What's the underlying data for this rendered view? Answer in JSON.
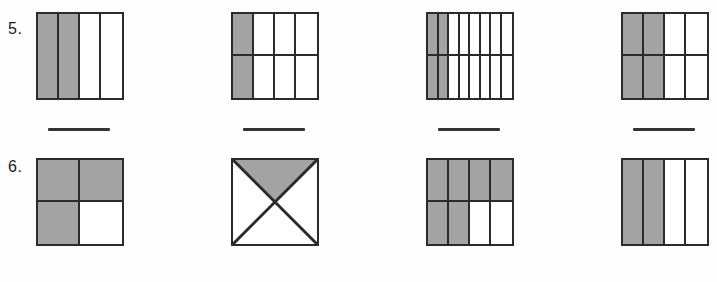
{
  "page": {
    "type": "fraction-shading-worksheet",
    "background_color": "#fefefe",
    "shade_color": "#a3a3a3",
    "line_color": "#2b2b2b",
    "width": 717,
    "height": 282
  },
  "rows": [
    {
      "number_label": "5.",
      "figures": [
        {
          "name": "figure-5-1",
          "shape": "grid",
          "columns": 4,
          "rows": 1,
          "total_parts": 4,
          "shaded_parts": 2,
          "shaded_cells": [
            0,
            1
          ],
          "fraction": "2/4"
        },
        {
          "name": "figure-5-2",
          "shape": "grid",
          "columns": 4,
          "rows": 2,
          "total_parts": 8,
          "shaded_parts": 2,
          "shaded_cells": [
            0,
            4
          ],
          "fraction": "2/8"
        },
        {
          "name": "figure-5-3",
          "shape": "grid",
          "columns": 8,
          "rows": 2,
          "total_parts": 16,
          "shaded_parts": 4,
          "shaded_cells": [
            0,
            1,
            8,
            9
          ],
          "fraction": "4/16"
        },
        {
          "name": "figure-5-4",
          "shape": "grid",
          "columns": 4,
          "rows": 2,
          "total_parts": 8,
          "shaded_parts": 4,
          "shaded_cells": [
            0,
            1,
            4,
            5
          ],
          "fraction": "4/8"
        }
      ],
      "answer_lines": 4
    },
    {
      "number_label": "6.",
      "figures": [
        {
          "name": "figure-6-1",
          "shape": "grid",
          "columns": 2,
          "rows": 2,
          "total_parts": 4,
          "shaded_parts": 3,
          "shaded_cells": [
            0,
            1,
            2
          ],
          "fraction": "3/4"
        },
        {
          "name": "figure-6-2",
          "shape": "diagonal-quarters",
          "total_parts": 4,
          "shaded_parts": 1,
          "shaded_regions": [
            "top"
          ],
          "fraction": "1/4"
        },
        {
          "name": "figure-6-3",
          "shape": "grid",
          "columns": 4,
          "rows": 2,
          "total_parts": 8,
          "shaded_parts": 6,
          "shaded_cells": [
            0,
            1,
            2,
            3,
            4,
            5
          ],
          "fraction": "6/8"
        },
        {
          "name": "figure-6-4",
          "shape": "grid",
          "columns": 4,
          "rows": 1,
          "total_parts": 4,
          "shaded_parts": 2,
          "shaded_cells": [
            0,
            1
          ],
          "fraction": "2/4"
        }
      ],
      "answer_lines": 4
    }
  ]
}
